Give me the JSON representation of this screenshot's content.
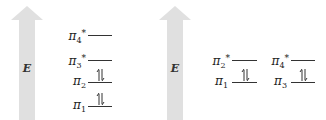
{
  "colors": {
    "arrow_fill": "#e0e0e0",
    "line": "#333333",
    "text": "#222222"
  },
  "diagrams": [
    {
      "axis_label": "E",
      "levels": [
        {
          "symbol": "π",
          "subscript": "4",
          "superscript": "*",
          "occupancy": "empty"
        },
        {
          "symbol": "π",
          "subscript": "3",
          "superscript": "*",
          "occupancy": "empty"
        },
        {
          "symbol": "π",
          "subscript": "2",
          "superscript": "",
          "occupancy": "paired"
        },
        {
          "symbol": "π",
          "subscript": "1",
          "superscript": "",
          "occupancy": "paired"
        }
      ]
    },
    {
      "axis_label": "E",
      "levels": [
        {
          "symbol": "π",
          "subscript": "2",
          "superscript": "*",
          "occupancy": "empty"
        },
        {
          "symbol": "π",
          "subscript": "1",
          "superscript": "",
          "occupancy": "paired"
        },
        {
          "symbol": "π",
          "subscript": "4",
          "superscript": "*",
          "occupancy": "empty"
        },
        {
          "symbol": "π",
          "subscript": "3",
          "superscript": "",
          "occupancy": "paired"
        }
      ]
    }
  ]
}
